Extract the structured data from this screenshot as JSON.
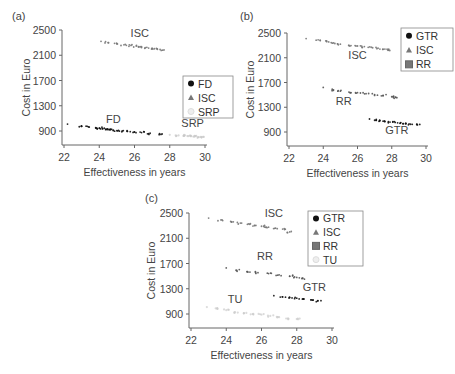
{
  "chart_data": [
    {
      "panel": "(a)",
      "type": "scatter",
      "xlabel": "Effectiveness in years",
      "ylabel": "Cost in Euro",
      "xlim": [
        22,
        30
      ],
      "ylim": [
        700,
        2500
      ],
      "xticks": [
        22,
        24,
        26,
        28,
        30
      ],
      "yticks": [
        900,
        1300,
        1700,
        2100,
        2500
      ],
      "legend": [
        "FD",
        "ISC",
        "SRP"
      ],
      "legend_position": "right-middle",
      "annotations": [
        {
          "text": "ISC",
          "x": 26.3,
          "y": 2390
        },
        {
          "text": "FD",
          "x": 24.8,
          "y": 1020
        },
        {
          "text": "SRP",
          "x": 29.3,
          "y": 960
        }
      ],
      "series": [
        {
          "name": "FD",
          "color": "#111111",
          "marker": "circle",
          "points": [
            [
              22.2,
              1010
            ],
            [
              23.0,
              975
            ],
            [
              23.4,
              965
            ],
            [
              23.8,
              955
            ],
            [
              24.0,
              945
            ],
            [
              24.2,
              935
            ],
            [
              24.4,
              930
            ],
            [
              24.6,
              925
            ],
            [
              24.8,
              915
            ],
            [
              25.0,
              905
            ],
            [
              25.3,
              900
            ],
            [
              25.6,
              895
            ],
            [
              26.0,
              885
            ],
            [
              26.4,
              875
            ],
            [
              26.8,
              860
            ],
            [
              27.5,
              845
            ]
          ]
        },
        {
          "name": "ISC",
          "color": "#777777",
          "marker": "triangle",
          "points": [
            [
              24.1,
              2320
            ],
            [
              24.5,
              2300
            ],
            [
              25.0,
              2280
            ],
            [
              25.4,
              2265
            ],
            [
              25.8,
              2255
            ],
            [
              26.1,
              2245
            ],
            [
              26.4,
              2235
            ],
            [
              26.7,
              2225
            ],
            [
              27.0,
              2210
            ],
            [
              27.3,
              2195
            ],
            [
              27.6,
              2180
            ]
          ]
        },
        {
          "name": "SRP",
          "color": "#c8c8c8",
          "marker": "circle-open",
          "points": [
            [
              28.0,
              840
            ],
            [
              28.5,
              830
            ],
            [
              28.8,
              825
            ],
            [
              29.0,
              820
            ],
            [
              29.2,
              815
            ],
            [
              29.4,
              810
            ],
            [
              29.6,
              805
            ],
            [
              29.8,
              800
            ]
          ]
        }
      ]
    },
    {
      "panel": "(b)",
      "type": "scatter",
      "xlabel": "Effectiveness in years",
      "ylabel": "Cost in Euro",
      "xlim": [
        22,
        30
      ],
      "ylim": [
        700,
        2500
      ],
      "xticks": [
        22,
        24,
        26,
        28,
        30
      ],
      "yticks": [
        900,
        1300,
        1700,
        2100,
        2500
      ],
      "legend": [
        "GTR",
        "ISC",
        "RR"
      ],
      "legend_position": "upper-right",
      "annotations": [
        {
          "text": "ISC",
          "x": 26.0,
          "y": 2080
        },
        {
          "text": "RR",
          "x": 25.2,
          "y": 1330
        },
        {
          "text": "GTR",
          "x": 28.3,
          "y": 870
        }
      ],
      "series": [
        {
          "name": "GTR",
          "color": "#111111",
          "marker": "circle",
          "points": [
            [
              26.7,
              1110
            ],
            [
              27.0,
              1090
            ],
            [
              27.3,
              1080
            ],
            [
              27.6,
              1070
            ],
            [
              27.9,
              1060
            ],
            [
              28.2,
              1055
            ],
            [
              28.5,
              1045
            ],
            [
              28.8,
              1035
            ],
            [
              29.1,
              1025
            ],
            [
              29.5,
              1015
            ]
          ]
        },
        {
          "name": "ISC",
          "color": "#777777",
          "marker": "triangle",
          "points": [
            [
              23.0,
              2410
            ],
            [
              23.7,
              2390
            ],
            [
              24.2,
              2360
            ],
            [
              24.6,
              2340
            ],
            [
              25.0,
              2320
            ],
            [
              25.5,
              2300
            ],
            [
              26.0,
              2290
            ],
            [
              26.4,
              2280
            ],
            [
              26.8,
              2270
            ],
            [
              27.2,
              2255
            ],
            [
              27.6,
              2240
            ],
            [
              27.8,
              2225
            ]
          ]
        },
        {
          "name": "RR",
          "color": "#555555",
          "marker": "square",
          "points": [
            [
              24.0,
              1620
            ],
            [
              24.6,
              1580
            ],
            [
              25.0,
              1560
            ],
            [
              25.5,
              1545
            ],
            [
              26.0,
              1535
            ],
            [
              26.5,
              1520
            ],
            [
              27.0,
              1505
            ],
            [
              27.5,
              1490
            ],
            [
              28.0,
              1470
            ],
            [
              28.3,
              1455
            ]
          ]
        }
      ]
    },
    {
      "panel": "(c)",
      "type": "scatter",
      "xlabel": "Effectiveness in years",
      "ylabel": "Cost in Euro",
      "xlim": [
        22,
        30
      ],
      "ylim": [
        700,
        2500
      ],
      "xticks": [
        22,
        24,
        26,
        28,
        30
      ],
      "yticks": [
        900,
        1300,
        1700,
        2100,
        2500
      ],
      "legend": [
        "GTR",
        "ISC",
        "RR",
        "TU"
      ],
      "legend_position": "upper-right",
      "annotations": [
        {
          "text": "ISC",
          "x": 26.7,
          "y": 2440
        },
        {
          "text": "RR",
          "x": 26.2,
          "y": 1760
        },
        {
          "text": "GTR",
          "x": 29.0,
          "y": 1260
        },
        {
          "text": "TU",
          "x": 24.5,
          "y": 1080
        }
      ],
      "series": [
        {
          "name": "GTR",
          "color": "#111111",
          "marker": "circle",
          "points": [
            [
              26.7,
              1190
            ],
            [
              27.2,
              1170
            ],
            [
              27.6,
              1160
            ],
            [
              28.0,
              1150
            ],
            [
              28.4,
              1140
            ],
            [
              28.8,
              1125
            ],
            [
              29.2,
              1110
            ]
          ]
        },
        {
          "name": "ISC",
          "color": "#777777",
          "marker": "triangle",
          "points": [
            [
              23.0,
              2420
            ],
            [
              23.7,
              2390
            ],
            [
              24.4,
              2360
            ],
            [
              24.8,
              2340
            ],
            [
              25.2,
              2320
            ],
            [
              25.6,
              2305
            ],
            [
              26.0,
              2290
            ],
            [
              26.4,
              2275
            ],
            [
              26.8,
              2260
            ],
            [
              27.2,
              2245
            ],
            [
              27.6,
              2200
            ]
          ]
        },
        {
          "name": "RR",
          "color": "#555555",
          "marker": "square",
          "points": [
            [
              24.0,
              1630
            ],
            [
              24.6,
              1590
            ],
            [
              25.2,
              1570
            ],
            [
              25.8,
              1555
            ],
            [
              26.4,
              1540
            ],
            [
              27.0,
              1520
            ],
            [
              27.6,
              1500
            ],
            [
              28.0,
              1480
            ],
            [
              28.3,
              1460
            ]
          ]
        },
        {
          "name": "TU",
          "color": "#cccccc",
          "marker": "circle-open",
          "points": [
            [
              22.9,
              1010
            ],
            [
              23.4,
              990
            ],
            [
              24.0,
              960
            ],
            [
              24.5,
              930
            ],
            [
              25.0,
              910
            ],
            [
              25.5,
              900
            ],
            [
              26.0,
              890
            ],
            [
              26.5,
              870
            ],
            [
              27.0,
              850
            ],
            [
              27.5,
              830
            ],
            [
              28.0,
              820
            ]
          ]
        }
      ]
    }
  ],
  "panels": {
    "a": {
      "label": "(a)"
    },
    "b": {
      "label": "(b)"
    },
    "c": {
      "label": "(c)"
    }
  }
}
